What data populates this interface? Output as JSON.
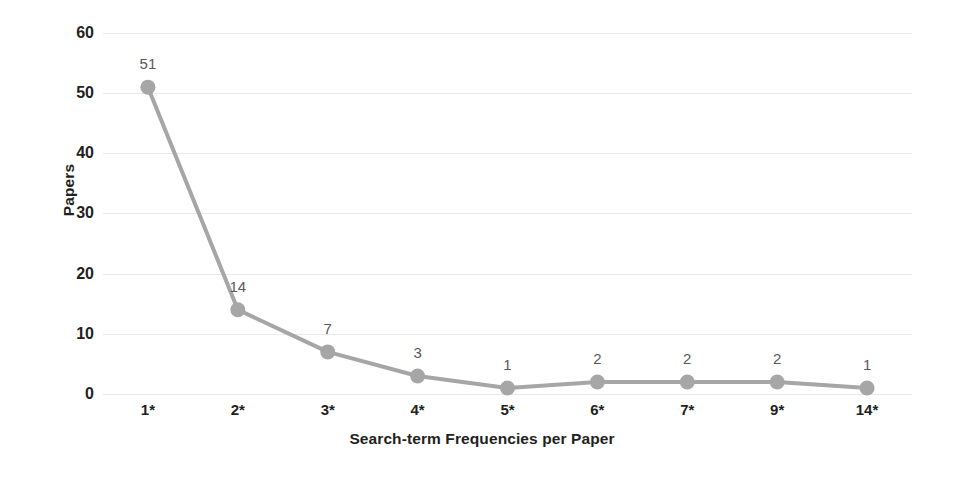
{
  "chart_data": {
    "type": "line",
    "title": "",
    "xlabel": "Search-term Frequencies per Paper",
    "ylabel": "Papers",
    "categories": [
      "1*",
      "2*",
      "3*",
      "4*",
      "5*",
      "6*",
      "7*",
      "9*",
      "14*"
    ],
    "values": [
      51,
      14,
      7,
      3,
      1,
      2,
      2,
      2,
      1
    ],
    "data_labels": [
      "51",
      "14",
      "7",
      "3",
      "1",
      "2",
      "2",
      "2",
      "1"
    ],
    "ylim": [
      0,
      60
    ],
    "ytick_step": 10,
    "ytick_labels": [
      "60",
      "50",
      "40",
      "30",
      "20",
      "10",
      "0"
    ],
    "ytick_values": [
      60,
      50,
      40,
      30,
      20,
      10,
      0
    ],
    "grid": true,
    "grid_axis": "y",
    "legend": false,
    "legend_position": "none",
    "series_color": "#a6a6a6",
    "marker_color": "#a6a6a6",
    "grid_color": "#e9eaec",
    "text_color": "#231f20",
    "label_color": "#58595b",
    "background": "#ffffff"
  }
}
